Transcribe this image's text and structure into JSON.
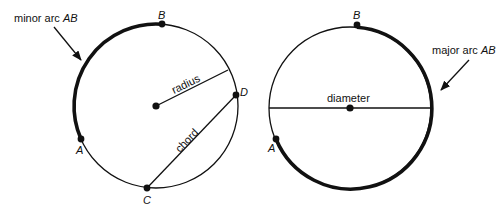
{
  "left_figure": {
    "arc_label_prefix": "minor arc ",
    "arc_label_name": "AB",
    "radius_label": "radius",
    "chord_label": "chord",
    "points": {
      "A": "A",
      "B": "B",
      "C": "C",
      "D": "D"
    }
  },
  "right_figure": {
    "arc_label_prefix": "major arc ",
    "arc_label_name": "AB",
    "diameter_label": "diameter",
    "points": {
      "A": "A",
      "B": "B"
    }
  },
  "colors": {
    "stroke": "#111111",
    "background": "#ffffff"
  }
}
